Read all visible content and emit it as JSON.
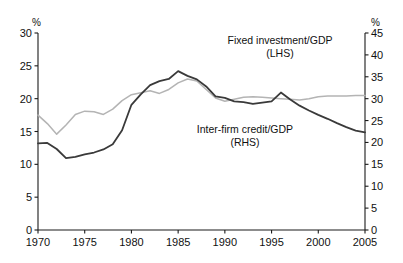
{
  "chart_data": {
    "type": "line",
    "title": "",
    "xlabel": "",
    "grid": false,
    "legend_position": "inline-annotations",
    "x_ticks": [
      1970,
      1975,
      1980,
      1985,
      1990,
      1995,
      2000,
      2005
    ],
    "xlim": [
      1970,
      2005
    ],
    "left_axis": {
      "unit_label": "%",
      "ylabel": "",
      "ylim": [
        0,
        30
      ],
      "ticks": [
        0,
        5,
        10,
        15,
        20,
        25,
        30
      ]
    },
    "right_axis": {
      "unit_label": "%",
      "ylabel": "",
      "ylim": [
        0,
        45
      ],
      "ticks": [
        0,
        5,
        10,
        15,
        20,
        25,
        30,
        35,
        40,
        45
      ]
    },
    "annotations": [
      {
        "name": "fixed-investment-label",
        "line1": "Fixed investment/GDP",
        "line2": "(LHS)",
        "x": 280,
        "y": 44
      },
      {
        "name": "inter-firm-credit-label",
        "line1": "Inter-firm credit/GDP",
        "line2": "(RHS)",
        "x": 245,
        "y": 133
      }
    ],
    "series": [
      {
        "name": "Fixed investment/GDP",
        "axis": "left",
        "color": "#b4b4b4",
        "x": [
          1970,
          1971,
          1972,
          1973,
          1974,
          1975,
          1976,
          1977,
          1978,
          1979,
          1980,
          1981,
          1982,
          1983,
          1984,
          1985,
          1986,
          1987,
          1988,
          1989,
          1990,
          1991,
          1992,
          1993,
          1994,
          1995,
          1996,
          1997,
          1998,
          1999,
          2000,
          2001,
          2002,
          2003,
          2004,
          2005
        ],
        "values": [
          17.5,
          16.2,
          14.6,
          16.0,
          17.6,
          18.1,
          18.0,
          17.6,
          18.4,
          19.7,
          20.6,
          20.9,
          21.2,
          20.8,
          21.4,
          22.4,
          23.0,
          22.7,
          21.4,
          20.1,
          19.6,
          19.9,
          20.2,
          20.3,
          20.2,
          20.1,
          20.0,
          19.9,
          19.8,
          20.0,
          20.3,
          20.4,
          20.4,
          20.4,
          20.5,
          20.5
        ]
      },
      {
        "name": "Inter-firm credit/GDP",
        "axis": "right",
        "color": "#3a3a3a",
        "x": [
          1970,
          1971,
          1972,
          1973,
          1974,
          1975,
          1976,
          1977,
          1978,
          1979,
          1980,
          1981,
          1982,
          1983,
          1984,
          1985,
          1986,
          1987,
          1988,
          1989,
          1990,
          1991,
          1992,
          1993,
          1994,
          1995,
          1996,
          1997,
          1998,
          1999,
          2000,
          2001,
          2002,
          2003,
          2004,
          2005
        ],
        "values": [
          19.8,
          19.9,
          18.5,
          16.4,
          16.7,
          17.3,
          17.7,
          18.4,
          19.6,
          22.8,
          28.6,
          31.0,
          33.1,
          34.0,
          34.5,
          36.3,
          35.2,
          34.4,
          32.8,
          30.5,
          30.2,
          29.4,
          29.2,
          28.8,
          29.1,
          29.4,
          31.4,
          29.8,
          28.4,
          27.3,
          26.3,
          25.4,
          24.4,
          23.5,
          22.7,
          22.3
        ]
      }
    ]
  }
}
